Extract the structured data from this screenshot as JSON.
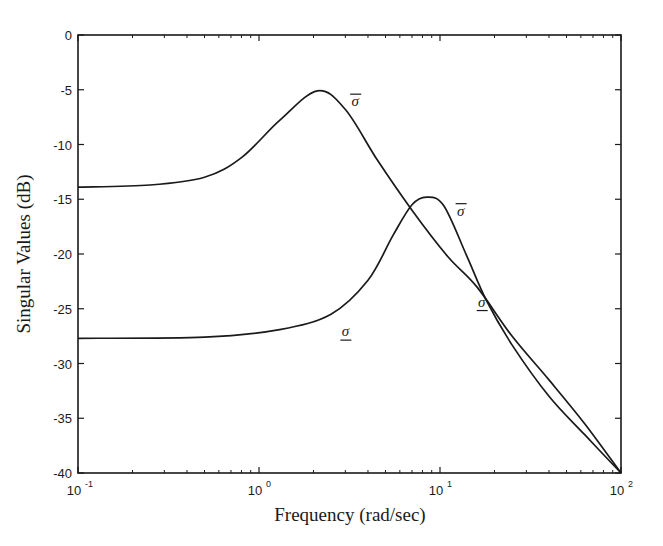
{
  "chart_data": {
    "type": "line",
    "title": "",
    "xlabel": "Frequency (rad/sec)",
    "ylabel": "Singular Values (dB)",
    "xscale": "log",
    "xlim": [
      0.1,
      100
    ],
    "ylim": [
      -40,
      0
    ],
    "grid": false,
    "legend": "none (inline curve annotations)",
    "x_ticks": [
      {
        "value": 0.1,
        "base": "10",
        "exp": "-1"
      },
      {
        "value": 1,
        "base": "10",
        "exp": "0"
      },
      {
        "value": 10,
        "base": "10",
        "exp": "1"
      },
      {
        "value": 100,
        "base": "10",
        "exp": "2"
      }
    ],
    "y_ticks": [
      "0",
      "-5",
      "-10",
      "-15",
      "-20",
      "-25",
      "-30",
      "-35",
      "-40"
    ],
    "series": [
      {
        "name": "σ̄ (max singular value)",
        "x": [
          0.1,
          0.25,
          0.5,
          0.8,
          1.3,
          2.1,
          3.0,
          4.5,
          7.0,
          11,
          16,
          25,
          40,
          63,
          100
        ],
        "values": [
          -13.9,
          -13.7,
          -13.0,
          -11.2,
          -7.8,
          -5.1,
          -6.8,
          -11.4,
          -16.0,
          -20.2,
          -23.0,
          -27.5,
          -31.5,
          -35.5,
          -40.0
        ]
      },
      {
        "name": "σ̲ (min singular value)",
        "x": [
          0.1,
          0.5,
          1.3,
          2.5,
          4.0,
          5.5,
          7.0,
          8.5,
          10.5,
          14,
          18,
          25,
          40,
          63,
          100
        ],
        "values": [
          -27.7,
          -27.6,
          -26.9,
          -25.5,
          -22.4,
          -18.3,
          -15.5,
          -14.8,
          -15.6,
          -20.1,
          -24.2,
          -28.3,
          -33.0,
          -36.5,
          -40.0
        ]
      }
    ],
    "annotations": [
      {
        "text": "σ̄",
        "x": 3.4,
        "y": -6.5,
        "series": "upper peak label"
      },
      {
        "text": "σ̄",
        "x": 13,
        "y": -16.5,
        "series": "second peak label"
      },
      {
        "text": "σ̲",
        "x": 3.0,
        "y": -27.5,
        "series": "lower curve label"
      },
      {
        "text": "σ̲",
        "x": 17,
        "y": -24.8,
        "series": "lower curve label (crossing)"
      }
    ]
  },
  "labels": {
    "xlabel": "Frequency (rad/sec)",
    "ylabel": "Singular Values (dB)",
    "sigma_bar": "σ",
    "sigma_under": "σ"
  }
}
